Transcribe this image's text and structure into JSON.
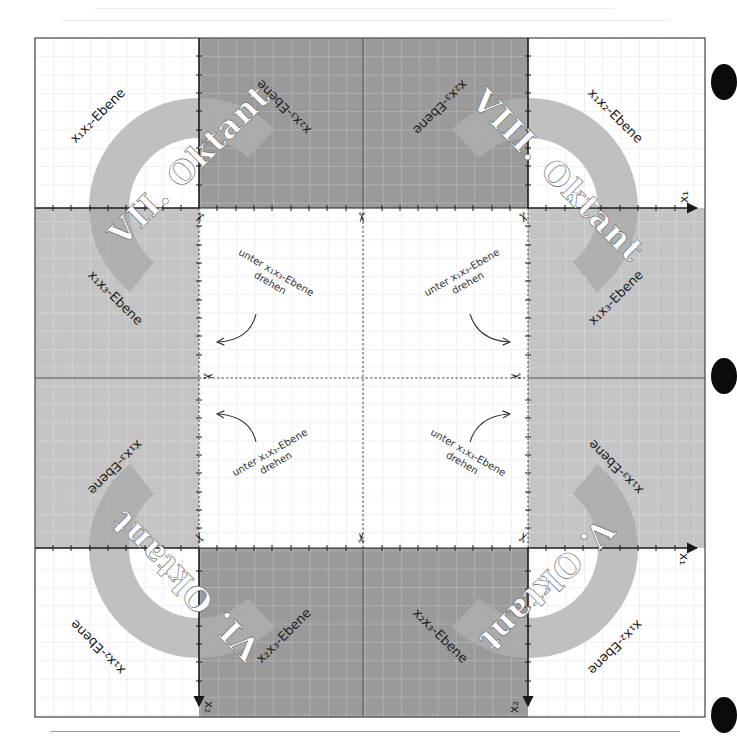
{
  "sheet": {
    "title": "Oktanten-Faltvorlage (untere Oktanten V–VIII)",
    "colors": {
      "white_panel": "#ffffff",
      "light_panel": "#c4c4c4",
      "dark_panel": "#9a9a9a",
      "arc_band": "#bdbdbd",
      "arc_band_on_dark": "#adadad",
      "arc_label_box": "#a9a9a9",
      "grid_line_on_white": "#dcdcdc",
      "grid_line_on_gray": "#e6e6e6",
      "axis": "#1a1a1a",
      "frame": "#333333",
      "cut_line": "#333333",
      "punch_hole": "#0a0a0a"
    }
  },
  "octants": [
    {
      "id": "VII",
      "label": "VII. Oktant",
      "corner": "top-left"
    },
    {
      "id": "VIII",
      "label": "VIII. Oktant",
      "corner": "top-right"
    },
    {
      "id": "VI",
      "label": "VI. Oktant",
      "corner": "bottom-left"
    },
    {
      "id": "V",
      "label": "V. Oktant",
      "corner": "bottom-right"
    }
  ],
  "plane_labels": {
    "x1x2": "x₁x₂-Ebene",
    "x1x3": "x₁x₃-Ebene",
    "x2x3": "x₂x₃-Ebene"
  },
  "instructions": [
    {
      "line1": "unter x₁x₃-Ebene",
      "line2": "drehen",
      "position": "upper-left",
      "arrow": "left"
    },
    {
      "line1": "unter x₁x₃-Ebene",
      "line2": "drehen",
      "position": "upper-right",
      "arrow": "right"
    },
    {
      "line1": "unter x₁x₃-Ebene",
      "line2": "drehen",
      "position": "lower-left",
      "arrow": "left"
    },
    {
      "line1": "unter x₁x₃-Ebene",
      "line2": "drehen",
      "position": "lower-right",
      "arrow": "right"
    }
  ],
  "axes": {
    "x1": "x₁",
    "x2": "x₂"
  },
  "icons": {
    "scissors": "✂"
  }
}
